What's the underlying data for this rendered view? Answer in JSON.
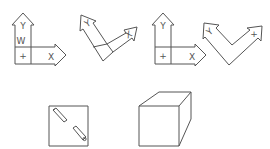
{
  "figures": [
    {
      "id": "axes-1",
      "labels": {
        "y": "Y",
        "w": "W",
        "origin": "+",
        "x": "X"
      }
    },
    {
      "id": "axes-2-rotated",
      "labels": {
        "y": "Y",
        "x": "X"
      }
    },
    {
      "id": "axes-3",
      "labels": {
        "y": "Y",
        "origin": "+",
        "x": "X"
      }
    },
    {
      "id": "axes-4-v-shape",
      "labels": {
        "left": "Y",
        "right": "+"
      }
    }
  ],
  "shapes": {
    "square": {
      "contents": "two pencils along diagonal"
    },
    "cube": {
      "style": "wireframe"
    }
  },
  "colors": {
    "stroke": "#555555",
    "background": "#ffffff"
  }
}
